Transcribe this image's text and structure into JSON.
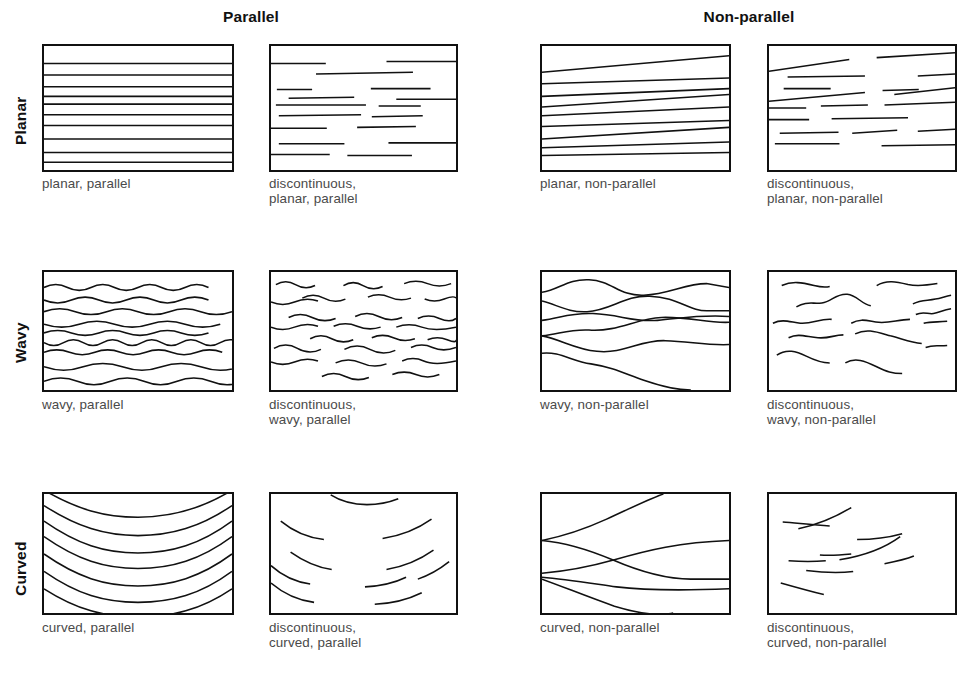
{
  "figure": {
    "background_color": "#ffffff",
    "line_color": "#111111",
    "caption_color": "#4a4a4a",
    "width": 972,
    "height": 677
  },
  "columns": [
    {
      "label": "Parallel",
      "center_x": 251
    },
    {
      "label": "Non-parallel",
      "center_x": 749
    }
  ],
  "rows": [
    {
      "label": "Planar"
    },
    {
      "label": "Wavy"
    },
    {
      "label": "Curved"
    }
  ],
  "panels": [
    {
      "id": "planar-parallel",
      "caption": "planar, parallel",
      "row": "Planar",
      "column": "Parallel",
      "continuity": "continuous",
      "geometry": "planar",
      "parallelism": "parallel"
    },
    {
      "id": "discontinuous-planar-parallel",
      "caption": "discontinuous,\nplanar, parallel",
      "row": "Planar",
      "column": "Parallel",
      "continuity": "discontinuous",
      "geometry": "planar",
      "parallelism": "parallel"
    },
    {
      "id": "planar-non-parallel",
      "caption": "planar, non-parallel",
      "row": "Planar",
      "column": "Non-parallel",
      "continuity": "continuous",
      "geometry": "planar",
      "parallelism": "non-parallel"
    },
    {
      "id": "discontinuous-planar-non-parallel",
      "caption": "discontinuous,\nplanar, non-parallel",
      "row": "Planar",
      "column": "Non-parallel",
      "continuity": "discontinuous",
      "geometry": "planar",
      "parallelism": "non-parallel"
    },
    {
      "id": "wavy-parallel",
      "caption": "wavy, parallel",
      "row": "Wavy",
      "column": "Parallel",
      "continuity": "continuous",
      "geometry": "wavy",
      "parallelism": "parallel"
    },
    {
      "id": "discontinuous-wavy-parallel",
      "caption": "discontinuous,\nwavy, parallel",
      "row": "Wavy",
      "column": "Parallel",
      "continuity": "discontinuous",
      "geometry": "wavy",
      "parallelism": "parallel"
    },
    {
      "id": "wavy-non-parallel",
      "caption": "wavy, non-parallel",
      "row": "Wavy",
      "column": "Non-parallel",
      "continuity": "continuous",
      "geometry": "wavy",
      "parallelism": "non-parallel"
    },
    {
      "id": "discontinuous-wavy-non-parallel",
      "caption": "discontinuous,\nwavy, non-parallel",
      "row": "Wavy",
      "column": "Non-parallel",
      "continuity": "discontinuous",
      "geometry": "wavy",
      "parallelism": "non-parallel"
    },
    {
      "id": "curved-parallel",
      "caption": "curved, parallel",
      "row": "Curved",
      "column": "Parallel",
      "continuity": "continuous",
      "geometry": "curved",
      "parallelism": "parallel"
    },
    {
      "id": "discontinuous-curved-parallel",
      "caption": "discontinuous,\ncurved, parallel",
      "row": "Curved",
      "column": "Parallel",
      "continuity": "discontinuous",
      "geometry": "curved",
      "parallelism": "parallel"
    },
    {
      "id": "curved-non-parallel",
      "caption": "curved, non-parallel",
      "row": "Curved",
      "column": "Non-parallel",
      "continuity": "continuous",
      "geometry": "curved",
      "parallelism": "non-parallel"
    },
    {
      "id": "discontinuous-curved-non-parallel",
      "caption": "discontinuous,\ncurved, non-parallel",
      "row": "Curved",
      "column": "Non-parallel",
      "continuity": "discontinuous",
      "geometry": "curved",
      "parallelism": "non-parallel"
    }
  ]
}
